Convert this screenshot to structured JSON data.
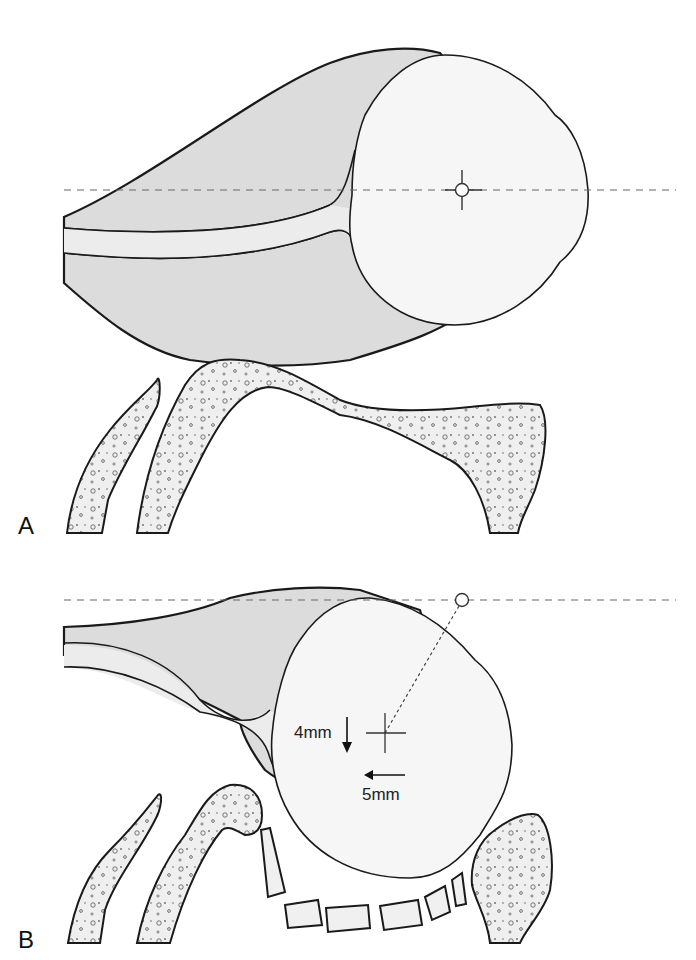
{
  "figure": {
    "panels": [
      {
        "id": "A",
        "label": "A"
      },
      {
        "id": "B",
        "label": "B",
        "annotations": {
          "vertical_shift": {
            "label": "4mm",
            "direction": "down"
          },
          "horizontal_shift": {
            "label": "5mm",
            "direction": "left"
          }
        }
      }
    ],
    "colors": {
      "soft_tissue_fill": "#dcdcdc",
      "head_fill": "#f4f4f4",
      "bone_fill": "#ececec",
      "outline": "#1a1a1a",
      "dashed_line": "#666666"
    },
    "icons": {
      "center_marker": "crosshair-circle-icon",
      "down_arrow": "arrow-down-icon",
      "left_arrow": "arrow-left-icon"
    }
  }
}
